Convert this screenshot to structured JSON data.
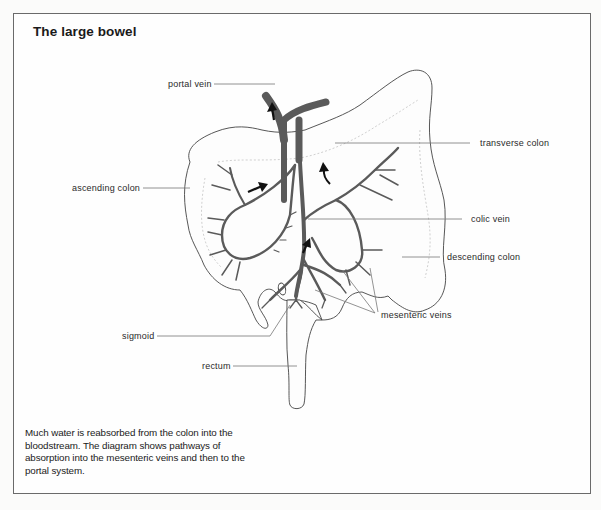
{
  "figure": {
    "title": "The large bowel",
    "caption": "Much water is reabsorbed from the colon into the bloodstream. The diagram shows pathways of absorption into the mesenteric veins and then to the portal system.",
    "colors": {
      "vein": "#5a5a5a",
      "outline": "#3a3a3a",
      "leader_line": "#777777",
      "arrow": "#111111",
      "frame": "#6a6a6a"
    }
  },
  "labels": {
    "portal_vein": "portal vein",
    "transverse_colon": "transverse colon",
    "ascending_colon": "ascending colon",
    "colic_vein": "colic vein",
    "descending_colon": "descending colon",
    "mesenteric_veins": "mesenteric veins",
    "sigmoid": "sigmoid",
    "rectum": "rectum"
  },
  "arrows": [
    {
      "id": "portal-up",
      "direction": "up"
    },
    {
      "id": "right-colic-flow",
      "direction": "right"
    },
    {
      "id": "left-colic-flow",
      "direction": "up-curved"
    },
    {
      "id": "mesenteric-flow",
      "direction": "up-right"
    }
  ]
}
